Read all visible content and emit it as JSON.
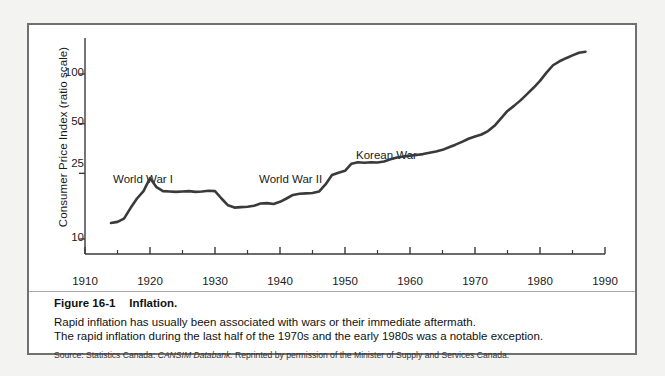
{
  "figure": {
    "number": "Figure 16-1",
    "title": "Inflation.",
    "description_line1": "Rapid inflation has usually been associated with wars or their immediate aftermath.",
    "description_line2": "The rapid inflation during the last half of the 1970s and the early 1980s was a notable exception.",
    "source_prefix": "Source: Statistics Canada:",
    "source_italic": "CANSIM Databank.",
    "source_suffix": "Reprinted by permission of the Minister of Supply and Services Canada."
  },
  "colors": {
    "frame": "#6f7072",
    "line": "#3a3a3a",
    "axis": "#3a3a3a",
    "text": "#1a1a1a",
    "page_background": "#f3f3f2",
    "plot_background": "#ffffff"
  },
  "chart_data": {
    "type": "line",
    "title": "",
    "xlabel": "",
    "ylabel": "Consumer Price Index (ratio scale)",
    "yscale": "log",
    "grid": false,
    "legend": "none",
    "xlim": [
      1910,
      1990
    ],
    "ylim": [
      8,
      160
    ],
    "xticks": [
      1910,
      1920,
      1930,
      1940,
      1950,
      1960,
      1970,
      1980,
      1990
    ],
    "xtick_labels": [
      "1910",
      "1920",
      "1930",
      "1940",
      "1950",
      "1960",
      "1970",
      "1980",
      "1990"
    ],
    "xminor_ticks": [
      1915,
      1925,
      1935,
      1945,
      1955,
      1965,
      1975,
      1985
    ],
    "yticks": [
      10,
      25,
      50,
      100
    ],
    "ytick_labels": [
      "10",
      "25",
      "50",
      "100"
    ],
    "annotations": [
      {
        "text": "World War I",
        "x": 1916.5,
        "y": 31.5
      },
      {
        "text": "World War II",
        "x": 1939.0,
        "y": 31.5
      },
      {
        "text": "Korean War",
        "x": 1952.5,
        "y": 44.0
      }
    ],
    "series": [
      {
        "name": "Consumer Price Index",
        "x": [
          1914,
          1915,
          1916,
          1917,
          1918,
          1919,
          1920,
          1921,
          1922,
          1923,
          1924,
          1925,
          1926,
          1927,
          1928,
          1929,
          1930,
          1931,
          1932,
          1933,
          1934,
          1935,
          1936,
          1937,
          1938,
          1939,
          1940,
          1941,
          1942,
          1943,
          1944,
          1945,
          1946,
          1947,
          1948,
          1949,
          1950,
          1951,
          1952,
          1953,
          1954,
          1955,
          1956,
          1957,
          1958,
          1959,
          1960,
          1961,
          1962,
          1963,
          1964,
          1965,
          1966,
          1967,
          1968,
          1969,
          1970,
          1971,
          1972,
          1973,
          1974,
          1975,
          1976,
          1977,
          1978,
          1979,
          1980,
          1981,
          1982,
          1983,
          1984,
          1985,
          1986,
          1987
        ],
        "values": [
          12.5,
          12.7,
          13.3,
          15.4,
          17.6,
          19.5,
          23.4,
          20.6,
          19.5,
          19.4,
          19.3,
          19.4,
          19.5,
          19.3,
          19.4,
          19.6,
          19.5,
          17.6,
          16.0,
          15.5,
          15.6,
          15.7,
          15.9,
          16.4,
          16.5,
          16.3,
          16.8,
          17.6,
          18.5,
          18.8,
          18.9,
          19.0,
          19.4,
          21.4,
          24.4,
          25.2,
          25.9,
          28.6,
          29.2,
          29.0,
          29.2,
          29.1,
          29.5,
          30.4,
          31.2,
          31.6,
          32.0,
          32.3,
          32.7,
          33.3,
          33.9,
          34.7,
          36.0,
          37.3,
          38.8,
          40.5,
          41.8,
          43.0,
          45.1,
          48.5,
          53.8,
          59.7,
          64.1,
          69.2,
          75.5,
          82.5,
          90.8,
          102.0,
          113.0,
          119.4,
          124.7,
          129.6,
          134.6,
          136.5
        ]
      }
    ]
  }
}
